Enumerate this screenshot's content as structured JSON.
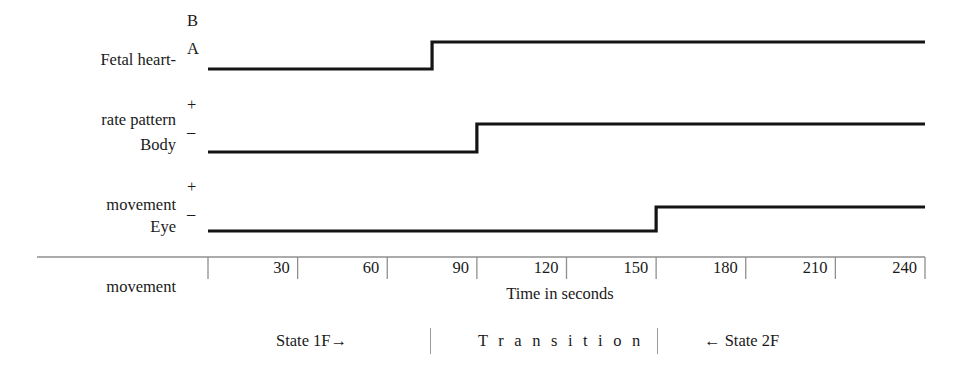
{
  "figure": {
    "type": "step-chart"
  },
  "rows": [
    {
      "id": "fetal-heart-rate-pattern",
      "label_line1": "Fetal heart-",
      "label_line2": "rate pattern",
      "level_high": "B",
      "level_low": "A",
      "transition_seconds": 75,
      "start_level": "A",
      "end_level": "B"
    },
    {
      "id": "body-movement",
      "label_line1": "Body",
      "label_line2": "movement",
      "level_high": "+",
      "level_low": "–",
      "transition_seconds": 90,
      "start_level": "–",
      "end_level": "+"
    },
    {
      "id": "eye-movement",
      "label_line1": "Eye",
      "label_line2": "movement",
      "level_high": "+",
      "level_low": "–",
      "transition_seconds": 150,
      "start_level": "–",
      "end_level": "+"
    }
  ],
  "axis": {
    "title": "Time in seconds",
    "ticks": [
      "30",
      "60",
      "90",
      "120",
      "150",
      "180",
      "210",
      "240"
    ],
    "min_seconds": 0,
    "max_seconds": 240,
    "tick_interval_seconds": 30
  },
  "states": {
    "left": "State 1F→",
    "middle": "T r a n s i t i o n",
    "right": "← State 2F"
  },
  "colors": {
    "trace": "#141414",
    "axis": "#8f8f8f",
    "text": "#1a1a1a",
    "background": "#ffffff"
  }
}
